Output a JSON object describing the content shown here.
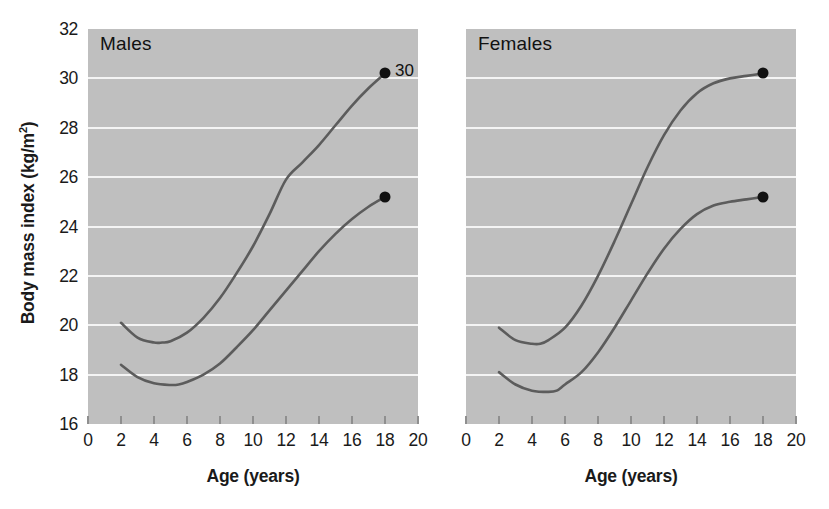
{
  "chart_data": {
    "type": "line",
    "title": "",
    "xlabel": "Age (years)",
    "ylabel": "Body mass index (kg/m2)",
    "ylabel_base": "Body mass index (kg/m",
    "ylabel_sup": "2",
    "ylabel_close": ")",
    "xlim": [
      0,
      20
    ],
    "ylim": [
      16,
      32
    ],
    "xticks": [
      0,
      2,
      4,
      6,
      8,
      10,
      12,
      14,
      16,
      18,
      20
    ],
    "yticks": [
      16,
      18,
      20,
      22,
      24,
      26,
      28,
      30,
      32
    ],
    "grid": "horizontal",
    "legend": "none",
    "plot_background": "#bfbfbf",
    "gridline_color": "#f4f4f4",
    "line_color": "#5c5c5c",
    "marker_color": "#111111",
    "panels": [
      {
        "label": "Males",
        "series": [
          {
            "name": "obesity-cutoff-males",
            "annotation": "30",
            "endpoint": {
              "x": 18,
              "y": 30.2
            },
            "x": [
              2,
              3,
              4,
              4.5,
              5,
              6,
              7,
              8,
              9,
              10,
              11,
              12,
              13,
              14,
              15,
              16,
              17,
              18
            ],
            "y": [
              20.1,
              19.5,
              19.3,
              19.3,
              19.35,
              19.7,
              20.3,
              21.1,
              22.1,
              23.2,
              24.5,
              25.9,
              26.6,
              27.3,
              28.1,
              28.9,
              29.6,
              30.2
            ]
          },
          {
            "name": "overweight-cutoff-males",
            "annotation": "",
            "endpoint": {
              "x": 18,
              "y": 25.2
            },
            "x": [
              2,
              3,
              4,
              5,
              5.5,
              6,
              7,
              8,
              9,
              10,
              11,
              12,
              13,
              14,
              15,
              16,
              17,
              18
            ],
            "y": [
              18.4,
              17.9,
              17.65,
              17.58,
              17.6,
              17.7,
              18.0,
              18.45,
              19.1,
              19.8,
              20.6,
              21.4,
              22.2,
              23.0,
              23.7,
              24.3,
              24.8,
              25.2
            ]
          }
        ]
      },
      {
        "label": "Females",
        "series": [
          {
            "name": "obesity-cutoff-females",
            "annotation": "",
            "endpoint": {
              "x": 18,
              "y": 30.2
            },
            "x": [
              2,
              3,
              4,
              4.5,
              5,
              6,
              7,
              8,
              9,
              10,
              11,
              12,
              13,
              14,
              15,
              16,
              17,
              18
            ],
            "y": [
              19.9,
              19.4,
              19.25,
              19.25,
              19.4,
              19.9,
              20.8,
              22.0,
              23.4,
              24.9,
              26.4,
              27.7,
              28.7,
              29.4,
              29.8,
              30.0,
              30.1,
              30.2
            ]
          },
          {
            "name": "overweight-cutoff-females",
            "annotation": "",
            "endpoint": {
              "x": 18,
              "y": 25.2
            },
            "x": [
              2,
              3,
              4,
              5,
              5.5,
              6,
              7,
              8,
              9,
              10,
              11,
              12,
              13,
              14,
              15,
              16,
              17,
              18
            ],
            "y": [
              18.1,
              17.6,
              17.35,
              17.3,
              17.35,
              17.6,
              18.1,
              18.9,
              19.9,
              21.0,
              22.1,
              23.1,
              23.9,
              24.5,
              24.85,
              25.0,
              25.1,
              25.2
            ]
          }
        ]
      }
    ]
  }
}
